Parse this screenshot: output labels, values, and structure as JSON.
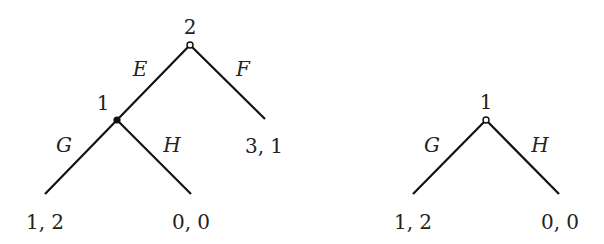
{
  "diagram": {
    "type": "game-tree",
    "colors": {
      "line": "#111111",
      "text": "#222222",
      "background": "#ffffff"
    },
    "left_tree": {
      "root": {
        "player": "2",
        "marker": "hollow"
      },
      "actions_root": {
        "left": "E",
        "right": "F"
      },
      "inner": {
        "player": "1",
        "marker": "filled"
      },
      "actions_inner": {
        "left": "G",
        "right": "H"
      },
      "payoffs": {
        "G": "1, 2",
        "H": "0, 0",
        "F": "3, 1"
      }
    },
    "right_tree": {
      "root": {
        "player": "1",
        "marker": "hollow"
      },
      "actions_root": {
        "left": "G",
        "right": "H"
      },
      "payoffs": {
        "G": "1, 2",
        "H": "0, 0"
      }
    }
  }
}
